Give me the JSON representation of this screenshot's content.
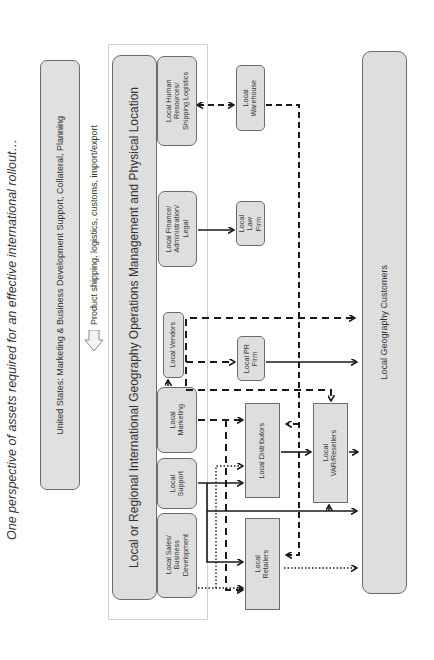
{
  "title": "One perspective of assets required for an effective international rollout…",
  "us_box": {
    "label": "United States: Marketing & Business Development Support, Collateral, Planning"
  },
  "shipping_note": {
    "label": "Product shipping, logistics, customs, import/export",
    "icon": "block-arrow-right-icon"
  },
  "operations": {
    "label": "Local or Regional International Geography Operations Management and Physical Location"
  },
  "departments": [
    {
      "id": "sales",
      "label": "Local Sales/\nBusiness\nDevelopment"
    },
    {
      "id": "support",
      "label": "Local\nSupport"
    },
    {
      "id": "marketing",
      "label": "Local\nMarketing"
    },
    {
      "id": "vendors",
      "label": "Local Vendors"
    },
    {
      "id": "finance",
      "label": "Local Finance/\nAdministration/\nLegal"
    },
    {
      "id": "hr",
      "label": "Local Human\nResources/\nShipping Logistics"
    }
  ],
  "partners": [
    {
      "id": "warehouse",
      "label": "Local\nWarehouse"
    },
    {
      "id": "law",
      "label": "Local\nLaw\nFirm"
    },
    {
      "id": "pr",
      "label": "Local PR\nFirm"
    },
    {
      "id": "distributors",
      "label": "Local Distributors"
    },
    {
      "id": "retailers",
      "label": "Local\nRetailers"
    },
    {
      "id": "var",
      "label": "Local\nVAR/Resellers"
    }
  ],
  "customers": {
    "label": "Local Geography Customers"
  },
  "colors": {
    "box_fill": "#dedede",
    "box_border": "#6b6b6b",
    "line": "#1a1a1a",
    "container_border": "#d0d0d0"
  }
}
